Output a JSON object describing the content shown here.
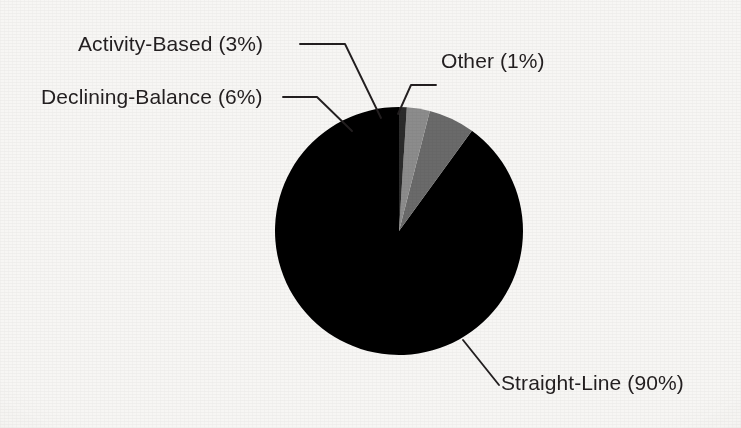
{
  "chart_data": {
    "type": "pie",
    "title": "",
    "subtitle": "",
    "xlabel": "",
    "ylabel": "",
    "legend_position": "none",
    "grid": false,
    "labels_style": "callout-with-leader-lines",
    "start_angle_deg": 90,
    "direction": "counterclockwise",
    "categories": [
      "Straight-Line",
      "Declining-Balance",
      "Activity-Based",
      "Other"
    ],
    "values": [
      90,
      6,
      3,
      1
    ],
    "units": "percent",
    "total": 100,
    "slices": [
      {
        "name": "Straight-Line",
        "value": 90,
        "percent_text": "90%",
        "label": "Straight-Line (90%)",
        "color": "#000000"
      },
      {
        "name": "Declining-Balance",
        "value": 6,
        "percent_text": "6%",
        "label": "Declining-Balance (6%)",
        "color": "#6a6a6a"
      },
      {
        "name": "Activity-Based",
        "value": 3,
        "percent_text": "3%",
        "label": "Activity-Based (3%)",
        "color": "#8c8c8c"
      },
      {
        "name": "Other",
        "value": 1,
        "percent_text": "1%",
        "label": "Other (1%)",
        "color": "#2b2b2b"
      }
    ]
  },
  "figure": {
    "background_color": "#f7f6f4",
    "text_color": "#231f20",
    "leader_line_color": "#231f20",
    "pie": {
      "center_x": 399,
      "center_y": 231,
      "radius": 124
    }
  }
}
